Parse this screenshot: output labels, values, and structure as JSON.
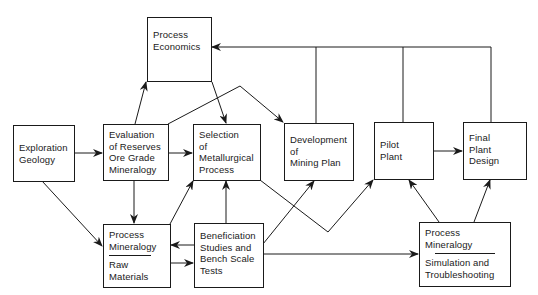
{
  "diagram": {
    "type": "flowchart",
    "nodes": {
      "process_economics": {
        "lines": [
          "Process",
          "Economics"
        ]
      },
      "exploration_geology": {
        "lines": [
          "Exploration",
          "Geology"
        ]
      },
      "evaluation_reserves": {
        "lines": [
          "Evaluation",
          "of Reserves",
          "Ore Grade",
          "Mineralogy"
        ]
      },
      "selection_metallurgical": {
        "lines": [
          "Selection",
          "of",
          "Metallurgical",
          "Process"
        ]
      },
      "development_mining": {
        "lines": [
          "Development",
          "of",
          "Mining Plan"
        ]
      },
      "pilot_plant": {
        "lines": [
          "Pilot",
          "Plant"
        ]
      },
      "final_plant_design": {
        "lines": [
          "Final",
          "Plant",
          "Design"
        ]
      },
      "process_mineralogy_raw": {
        "top": [
          "Process",
          "Mineralogy"
        ],
        "bottom": [
          "Raw",
          "Materials"
        ]
      },
      "beneficiation": {
        "lines": [
          "Beneficiation",
          "Studies and",
          "Bench Scale",
          "Tests"
        ]
      },
      "process_mineralogy_sim": {
        "top": [
          "Process",
          "Mineralogy"
        ],
        "bottom": [
          "Simulation and",
          "Troubleshooting"
        ]
      }
    },
    "edges": [
      {
        "from": "exploration_geology",
        "to": "evaluation_reserves"
      },
      {
        "from": "exploration_geology",
        "to": "process_mineralogy_raw"
      },
      {
        "from": "evaluation_reserves",
        "to": "process_economics"
      },
      {
        "from": "evaluation_reserves",
        "to": "selection_metallurgical"
      },
      {
        "from": "evaluation_reserves",
        "to": "development_mining"
      },
      {
        "from": "evaluation_reserves",
        "to": "process_mineralogy_raw"
      },
      {
        "from": "process_economics",
        "to": "selection_metallurgical"
      },
      {
        "from": "process_mineralogy_raw",
        "to": "selection_metallurgical"
      },
      {
        "from": "process_mineralogy_raw",
        "to": "beneficiation"
      },
      {
        "from": "beneficiation",
        "to": "process_mineralogy_raw"
      },
      {
        "from": "beneficiation",
        "to": "selection_metallurgical"
      },
      {
        "from": "beneficiation",
        "to": "development_mining"
      },
      {
        "from": "beneficiation",
        "to": "process_mineralogy_sim"
      },
      {
        "from": "selection_metallurgical",
        "to": "pilot_plant"
      },
      {
        "from": "pilot_plant",
        "to": "final_plant_design"
      },
      {
        "from": "process_mineralogy_sim",
        "to": "pilot_plant"
      },
      {
        "from": "process_mineralogy_sim",
        "to": "final_plant_design"
      },
      {
        "from": "development_mining",
        "to": "process_economics",
        "note": "feedback bus"
      },
      {
        "from": "pilot_plant",
        "to": "process_economics",
        "note": "feedback bus"
      },
      {
        "from": "final_plant_design",
        "to": "process_economics",
        "note": "feedback bus"
      }
    ]
  }
}
